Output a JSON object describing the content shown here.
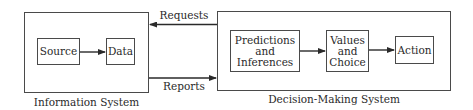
{
  "diagram": {
    "information_system": {
      "label": "Information System",
      "nodes": [
        {
          "id": "source",
          "label": "Source"
        },
        {
          "id": "data",
          "label": "Data"
        }
      ]
    },
    "decision_system": {
      "label": "Decision-Making System",
      "nodes": [
        {
          "id": "predictions",
          "lines": [
            "Predictions",
            "and",
            "Inferences"
          ]
        },
        {
          "id": "values",
          "lines": [
            "Values",
            "and",
            "Choice"
          ]
        },
        {
          "id": "action",
          "label": "Action"
        }
      ]
    },
    "flows": {
      "requests": "Requests",
      "reports": "Reports"
    },
    "edges": [
      {
        "from": "source",
        "to": "data"
      },
      {
        "from": "predictions",
        "to": "values"
      },
      {
        "from": "values",
        "to": "action"
      },
      {
        "from": "decision_system",
        "to": "information_system",
        "label": "Requests"
      },
      {
        "from": "information_system",
        "to": "decision_system",
        "label": "Reports"
      }
    ]
  }
}
